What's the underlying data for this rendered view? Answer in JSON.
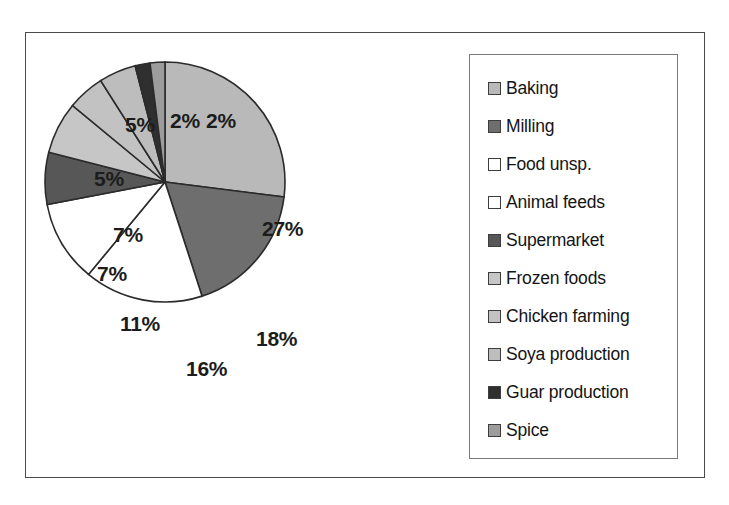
{
  "chart_data": {
    "type": "pie",
    "title": "",
    "categories": [
      "Baking",
      "Milling",
      "Food unsp.",
      "Animal feeds",
      "Supermarket",
      "Frozen foods",
      "Chicken farming",
      "Soya production",
      "Guar production",
      "Spice"
    ],
    "values": [
      27,
      18,
      16,
      11,
      7,
      7,
      5,
      5,
      2,
      2
    ],
    "value_labels": [
      "27%",
      "18%",
      "16%",
      "11%",
      "7%",
      "7%",
      "5%",
      "5%",
      "2%",
      "2%"
    ],
    "unit": "%",
    "start_angle_deg": 0,
    "direction": "clockwise",
    "legend_position": "right",
    "grid": false,
    "slice_colors": [
      "#b9b9b9",
      "#6e6e6e",
      "#ffffff",
      "#ffffff",
      "#575757",
      "#c6c6c6",
      "#c2c2c2",
      "#bdbdbd",
      "#2f2f2f",
      "#9c9c9c"
    ],
    "outline_color": "#2b2b2b",
    "slices": [
      {
        "label": "Baking",
        "value": 27,
        "display": "27%",
        "color": "#b9b9b9"
      },
      {
        "label": "Milling",
        "value": 18,
        "display": "18%",
        "color": "#6e6e6e"
      },
      {
        "label": "Food unsp.",
        "value": 16,
        "display": "16%",
        "color": "#ffffff"
      },
      {
        "label": "Animal feeds",
        "value": 11,
        "display": "11%",
        "color": "#ffffff"
      },
      {
        "label": "Supermarket",
        "value": 7,
        "display": "7%",
        "color": "#575757"
      },
      {
        "label": "Frozen foods",
        "value": 7,
        "display": "7%",
        "color": "#c6c6c6"
      },
      {
        "label": "Chicken farming",
        "value": 5,
        "display": "5%",
        "color": "#c2c2c2"
      },
      {
        "label": "Soya production",
        "value": 5,
        "display": "5%",
        "color": "#bdbdbd"
      },
      {
        "label": "Guar production",
        "value": 2,
        "display": "2%",
        "color": "#2f2f2f"
      },
      {
        "label": "Spice",
        "value": 2,
        "display": "2%",
        "color": "#9c9c9c"
      }
    ]
  },
  "legend": {
    "items": [
      {
        "label": "Baking",
        "color": "#b9b9b9"
      },
      {
        "label": "Milling",
        "color": "#6e6e6e"
      },
      {
        "label": "Food unsp.",
        "color": "#ffffff"
      },
      {
        "label": "Animal feeds",
        "color": "#ffffff"
      },
      {
        "label": "Supermarket",
        "color": "#575757"
      },
      {
        "label": "Frozen foods",
        "color": "#c6c6c6"
      },
      {
        "label": "Chicken farming",
        "color": "#c2c2c2"
      },
      {
        "label": "Soya production",
        "color": "#bdbdbd"
      },
      {
        "label": "Guar production",
        "color": "#2f2f2f"
      },
      {
        "label": "Spice",
        "color": "#9c9c9c"
      }
    ]
  },
  "label_positions": [
    {
      "display": "27%",
      "x": 236,
      "y": 184
    },
    {
      "display": "18%",
      "x": 230,
      "y": 294
    },
    {
      "display": "16%",
      "x": 160,
      "y": 324
    },
    {
      "display": "11%",
      "x": 94,
      "y": 279
    },
    {
      "display": "7%",
      "x": 71,
      "y": 229
    },
    {
      "display": "7%",
      "x": 87,
      "y": 190
    },
    {
      "display": "5%",
      "x": 68,
      "y": 134
    },
    {
      "display": "5%",
      "x": 99,
      "y": 80
    },
    {
      "display": "2%",
      "x": 144,
      "y": 76
    },
    {
      "display": "2%",
      "x": 180,
      "y": 76
    }
  ]
}
